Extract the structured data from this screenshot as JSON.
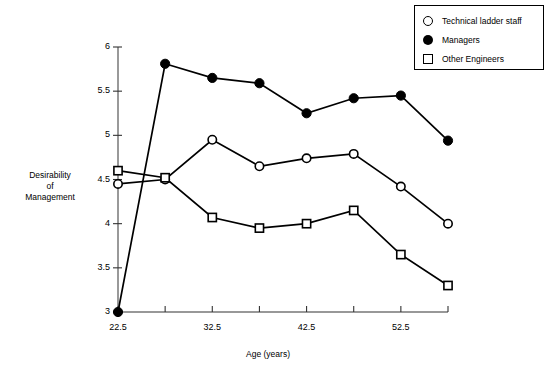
{
  "chart_data": {
    "type": "line",
    "title": "",
    "xlabel": "Age (years)",
    "ylabel": "Desirability of Management",
    "ylabel_lines": [
      "Desirability",
      "of",
      "Management"
    ],
    "x": [
      22.5,
      27.5,
      32.5,
      37.5,
      42.5,
      47.5,
      52.5,
      57.5
    ],
    "xlim": [
      22.5,
      57.5
    ],
    "ylim": [
      3,
      6
    ],
    "xticks_major": [
      22.5,
      32.5,
      42.5,
      52.5
    ],
    "xticks_minor": [
      27.5,
      37.5,
      47.5,
      57.5
    ],
    "xtick_labels": [
      "22.5",
      "32.5",
      "42.5",
      "52.5"
    ],
    "yticks": [
      3,
      3.5,
      4,
      4.5,
      5,
      5.5,
      6
    ],
    "ytick_labels": [
      "3",
      "3.5",
      "4",
      "4.5",
      "5",
      "5.5",
      "6"
    ],
    "grid": false,
    "legend_position": "top-right",
    "series": [
      {
        "name": "Technical ladder staff",
        "marker": "open-circle",
        "values": [
          4.45,
          4.5,
          4.95,
          4.65,
          4.74,
          4.79,
          4.42,
          4.0
        ]
      },
      {
        "name": "Managers",
        "marker": "filled-circle",
        "values": [
          3.0,
          5.81,
          5.65,
          5.59,
          5.25,
          5.42,
          5.45,
          4.94
        ]
      },
      {
        "name": "Other Engineers",
        "marker": "open-square",
        "values": [
          4.6,
          4.52,
          4.07,
          3.95,
          4.0,
          4.15,
          3.65,
          3.3
        ]
      }
    ]
  },
  "legend": {
    "items": [
      {
        "label": "Technical ladder staff",
        "marker": "open-circle"
      },
      {
        "label": "Managers",
        "marker": "filled-circle"
      },
      {
        "label": "Other Engineers",
        "marker": "open-square"
      }
    ]
  }
}
